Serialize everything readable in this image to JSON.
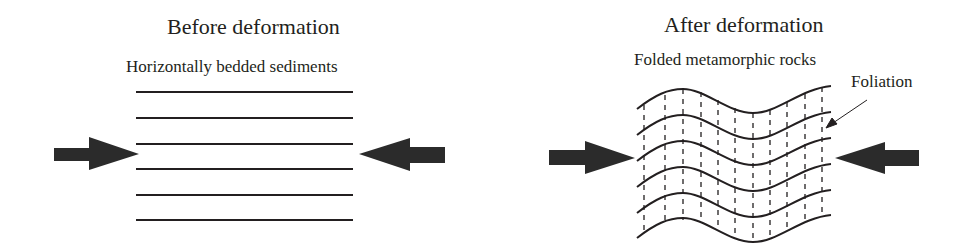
{
  "panels": [
    {
      "id": "before",
      "title": "Before deformation",
      "subtitle": "Horizontally bedded sediments",
      "layer_count": 6,
      "layer_style": "straight horizontal lines"
    },
    {
      "id": "after",
      "title": "After deformation",
      "subtitle": "Folded metamorphic rocks",
      "layer_count": 6,
      "layer_style": "wavy folded lines with dashed vertical foliation",
      "callout": "Foliation"
    }
  ],
  "arrows": {
    "meaning": "compressional stress",
    "color": "#2b2b2b"
  },
  "colors": {
    "ink": "#231f20",
    "arrow_fill": "#2b2b2b",
    "background": "#ffffff"
  }
}
